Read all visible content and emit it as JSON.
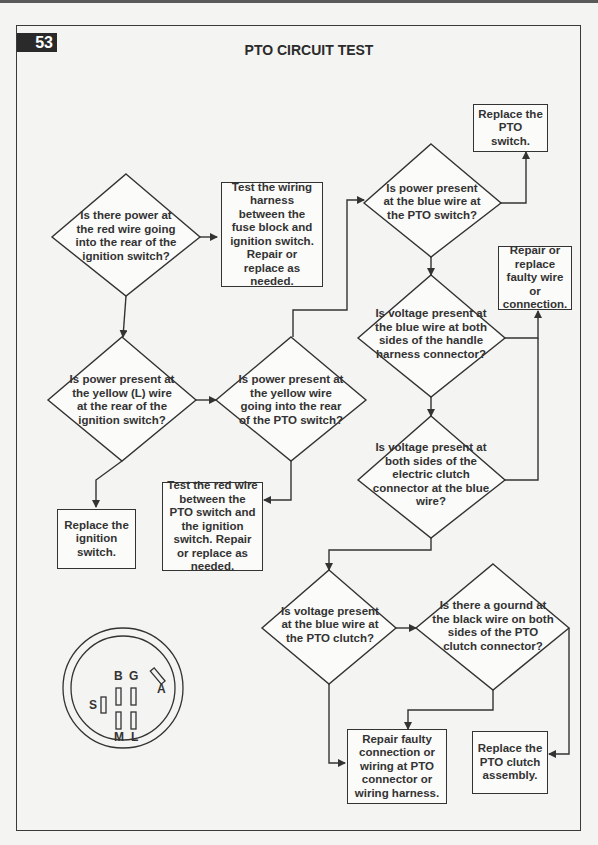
{
  "page": {
    "number": "53",
    "title": "PTO CIRCUIT TEST"
  },
  "nodes": {
    "d1": {
      "type": "decision",
      "text": "Is there power at the red wire going into the rear of the ignition switch?"
    },
    "b1": {
      "type": "action",
      "text": "Test the wiring harness between the fuse block and ignition switch. Repair or replace as needed."
    },
    "d2": {
      "type": "decision",
      "text": "Is power present at the yellow (L) wire at the rear of the ignition switch?"
    },
    "b2": {
      "type": "action",
      "text": "Replace the ignition switch."
    },
    "d3": {
      "type": "decision",
      "text": "Is power present at the yellow wire going into the rear of the PTO switch?"
    },
    "b3": {
      "type": "action",
      "text": "Test the red wire between the PTO switch and the ignition switch. Repair or replace as needed."
    },
    "d4": {
      "type": "decision",
      "text": "Is power present at the blue wire at the PTO switch?"
    },
    "b4": {
      "type": "action",
      "text": "Replace the PTO switch."
    },
    "d5": {
      "type": "decision",
      "text": "Is voltage present at the blue wire at both sides of the handle harness connector?"
    },
    "b5": {
      "type": "action",
      "text": "Repair or replace faulty wire or connection."
    },
    "d6": {
      "type": "decision",
      "text": "Is voltage present at both sides of the electric clutch connector at the blue wire?"
    },
    "d7": {
      "type": "decision",
      "text": "Is voltage present at the blue wire at the PTO clutch?"
    },
    "d8": {
      "type": "decision",
      "text": "Is there a gournd at the black wire on both sides of the PTO clutch connector?"
    },
    "b6": {
      "type": "action",
      "text": "Repair faulty connection or wiring at PTO connector or wiring harness."
    },
    "b7": {
      "type": "action",
      "text": "Replace the PTO clutch assembly."
    }
  },
  "edges": [
    {
      "from": "d1",
      "to": "b1"
    },
    {
      "from": "d1",
      "to": "d2"
    },
    {
      "from": "d2",
      "to": "b2"
    },
    {
      "from": "d2",
      "to": "d3"
    },
    {
      "from": "d3",
      "to": "d4"
    },
    {
      "from": "d3",
      "to": "b3"
    },
    {
      "from": "d4",
      "to": "b4"
    },
    {
      "from": "d4",
      "to": "d5"
    },
    {
      "from": "d5",
      "to": "b5"
    },
    {
      "from": "d5",
      "to": "d6"
    },
    {
      "from": "d6",
      "to": "b5"
    },
    {
      "from": "d6",
      "to": "d7"
    },
    {
      "from": "d7",
      "to": "d8"
    },
    {
      "from": "d7",
      "to": "b6"
    },
    {
      "from": "d8",
      "to": "b6"
    },
    {
      "from": "d8",
      "to": "b7"
    }
  ],
  "ignition_switch_diagram": {
    "pins": [
      "B",
      "G",
      "S",
      "M",
      "L",
      "A"
    ]
  }
}
